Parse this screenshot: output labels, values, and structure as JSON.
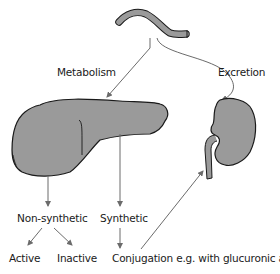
{
  "diagram": {
    "labels": {
      "metabolism": "Metabolism",
      "excretion": "Excretion",
      "non_synthetic": "Non-synthetic",
      "synthetic": "Synthetic",
      "active": "Active",
      "inactive": "Inactive",
      "conjugation": "Conjugation e.g. with glucuronic acid"
    },
    "nodes": [
      {
        "id": "intestine",
        "icon": "intestine-icon"
      },
      {
        "id": "liver",
        "icon": "liver-icon"
      },
      {
        "id": "kidney",
        "icon": "kidney-icon"
      }
    ],
    "edges": [
      {
        "from": "intestine",
        "to": "liver",
        "label": "Metabolism"
      },
      {
        "from": "intestine",
        "to": "kidney",
        "label": "Excretion"
      },
      {
        "from": "liver",
        "to": "Non-synthetic"
      },
      {
        "from": "liver",
        "to": "Synthetic"
      },
      {
        "from": "Non-synthetic",
        "to": "Active"
      },
      {
        "from": "Non-synthetic",
        "to": "Inactive"
      },
      {
        "from": "Synthetic",
        "to": "Conjugation e.g. with glucuronic acid"
      },
      {
        "from": "Conjugation e.g. with glucuronic acid",
        "to": "kidney"
      }
    ],
    "colors": {
      "organ_fill": "#9a9a9a",
      "organ_stroke": "#1a1a1a",
      "arrow": "#6b6b6b",
      "text": "#1a1a1a"
    }
  }
}
